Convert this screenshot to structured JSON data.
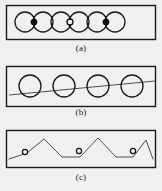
{
  "figure": {
    "background_color": "#f2f0ee",
    "stroke_color": "#1a1a1a",
    "panels": [
      {
        "id": "a",
        "caption": "(a)",
        "description": "Row of six overlapping circles inside a rectangular frame, with markers at three of the intersection points",
        "frame": {
          "x": 6,
          "y": 5,
          "width": 150,
          "height": 35
        },
        "circle_radius": 10,
        "circle_centers_x": [
          25,
          43,
          61,
          79,
          97,
          115
        ],
        "circle_center_y": 22,
        "markers": [
          {
            "x": 34,
            "y": 22,
            "style": "filled"
          },
          {
            "x": 70,
            "y": 22,
            "style": "hollow"
          },
          {
            "x": 106,
            "y": 22,
            "style": "filled"
          }
        ]
      },
      {
        "id": "b",
        "caption": "(b)",
        "description": "Row of four separated circles inside a rectangular frame, crossed by a single straight line sloping upward to the right",
        "frame": {
          "x": 6,
          "y": 5,
          "width": 150,
          "height": 40
        },
        "circle_radius": 11,
        "circle_centers_x": [
          30,
          64,
          98,
          132
        ],
        "circle_center_y": 24,
        "line": {
          "x1": 9,
          "y1": 33,
          "x2": 155,
          "y2": 19
        }
      },
      {
        "id": "c",
        "caption": "(c)",
        "description": "Zigzag polyline inside a rectangular frame with three small hollow circle markers placed on the rising segments",
        "frame": {
          "x": 6,
          "y": 4,
          "width": 150,
          "height": 38
        },
        "polyline_points": "9,33 27,27 44,13 62,31 80,31 98,12 116,31 133,31 146,14 153,33",
        "markers": [
          {
            "x": 25,
            "y": 26,
            "style": "hollow"
          },
          {
            "x": 79,
            "y": 24,
            "style": "hollow"
          },
          {
            "x": 133,
            "y": 24,
            "style": "hollow"
          }
        ]
      }
    ]
  }
}
